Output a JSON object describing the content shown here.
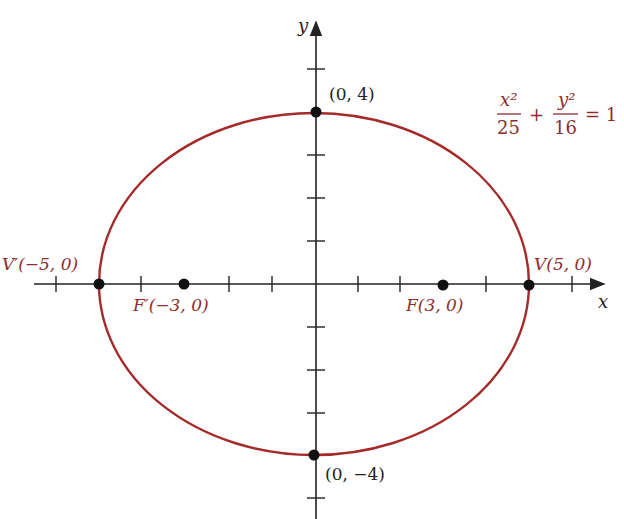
{
  "figure": {
    "type": "ellipse-diagram",
    "equation": {
      "term1_num": "x²",
      "term1_den": "25",
      "plus": "+",
      "term2_num": "y²",
      "term2_den": "16",
      "equals": "= 1"
    },
    "axes": {
      "x_label": "x",
      "y_label": "y"
    },
    "points": [
      {
        "id": "vertex-right",
        "label": "V(5, 0)",
        "x": 5,
        "y": 0
      },
      {
        "id": "vertex-left",
        "label": "V′(−5, 0)",
        "x": -5,
        "y": 0
      },
      {
        "id": "focus-right",
        "label": "F(3, 0)",
        "x": 3,
        "y": 0
      },
      {
        "id": "focus-left",
        "label": "F′(−3, 0)",
        "x": -3,
        "y": 0
      },
      {
        "id": "covertex-top",
        "label": "(0, 4)",
        "x": 0,
        "y": 4
      },
      {
        "id": "covertex-bottom",
        "label": "(0, −4)",
        "x": 0,
        "y": -4
      }
    ],
    "ellipse": {
      "a": 5,
      "b": 4,
      "center": [
        0,
        0
      ]
    },
    "x_ticks": [
      -6,
      -5,
      -4,
      -3,
      -2,
      -1,
      1,
      2,
      3,
      4,
      5,
      6
    ],
    "y_ticks": [
      -5,
      -4,
      -3,
      -2,
      -1,
      1,
      2,
      3,
      4,
      5
    ],
    "colors": {
      "curve": "#a52a2a",
      "labels": "#8a2e2e",
      "axes": "#222222"
    }
  }
}
